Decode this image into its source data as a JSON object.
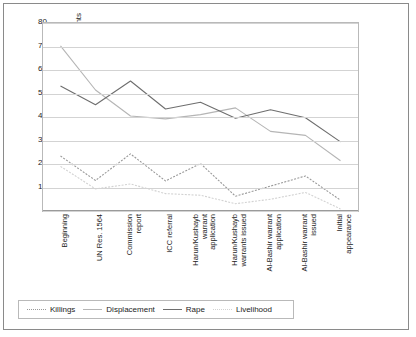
{
  "chart_data": {
    "type": "line",
    "title": "",
    "xlabel": "",
    "ylabel": "Percentage of media documents",
    "ylim": [
      0,
      80
    ],
    "ytick_step": 10,
    "yticks": [
      "80",
      "70",
      "60",
      "50",
      "40",
      "30",
      "20",
      "10",
      "0"
    ],
    "grid": true,
    "legend_position": "bottom",
    "categories": [
      "Beginning",
      "UN Res. 1564",
      "Commission report",
      "ICC referral",
      "Harun/Kushayb warrant application",
      "Harun/Kushayb warrants issued",
      "Al-Bashir warrant application",
      "Al-Bashir warrant issued",
      "Initial appearance"
    ],
    "category_lines": [
      [
        "Beginning"
      ],
      [
        "UN Res. 1564"
      ],
      [
        "Commission",
        "report"
      ],
      [
        "ICC referral"
      ],
      [
        "Harun/Kushayb",
        "warrant",
        "application"
      ],
      [
        "Harun/Kushayb",
        "warrants issued"
      ],
      [
        "Al-Bashir warrant",
        "application"
      ],
      [
        "Al-Bashir warrant",
        "issued"
      ],
      [
        "Initial",
        "appearance"
      ]
    ],
    "series": [
      {
        "name": "Killings",
        "color": "#999999",
        "style": "dotted",
        "values": [
          23.4,
          13.0,
          24.3,
          12.8,
          20.2,
          6.3,
          10.6,
          14.9,
          4.6
        ]
      },
      {
        "name": "Displacement",
        "color": "#b5b5b5",
        "style": "solid",
        "values": [
          70.3,
          51.5,
          40.4,
          39.2,
          41.0,
          43.9,
          33.9,
          32.2,
          21.4
        ]
      },
      {
        "name": "Rape",
        "color": "#6e6e6e",
        "style": "solid",
        "values": [
          53.2,
          45.2,
          55.3,
          43.4,
          46.3,
          39.5,
          43.1,
          39.7,
          29.4
        ]
      },
      {
        "name": "Livelihood",
        "color": "#d2d2d2",
        "style": "dotted",
        "values": [
          19.0,
          9.4,
          11.5,
          7.4,
          6.7,
          3.1,
          5.0,
          7.9,
          0.9
        ]
      }
    ]
  },
  "legend": {
    "items": [
      {
        "label": "Killings"
      },
      {
        "label": "Displacement"
      },
      {
        "label": "Rape"
      },
      {
        "label": "Livelihood"
      }
    ]
  }
}
